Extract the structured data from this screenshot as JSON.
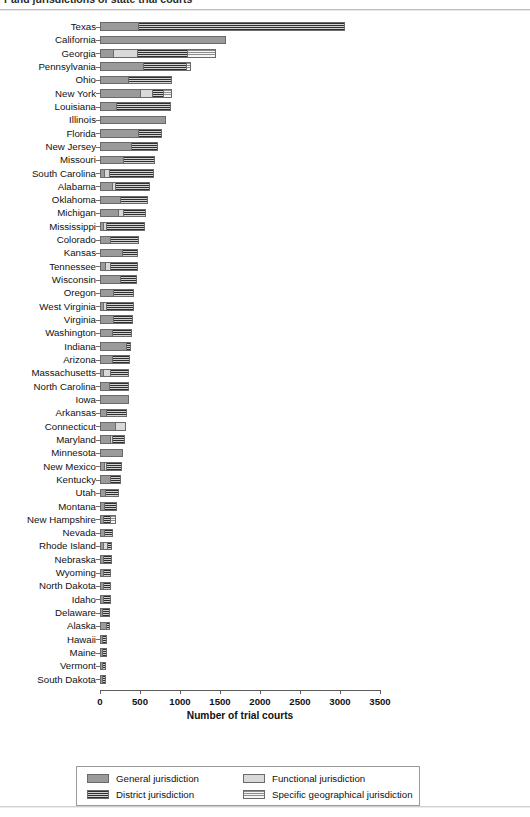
{
  "title": "r and jurisdictions of state trial courts",
  "axis": {
    "xlabel": "Number of trial courts",
    "xticks": [
      "0",
      "500",
      "1000",
      "1500",
      "2000",
      "2500",
      "3000",
      "3500"
    ]
  },
  "legend": {
    "items": [
      {
        "key": "general",
        "label": "General jurisdiction"
      },
      {
        "key": "functional",
        "label": "Functional jurisdiction"
      },
      {
        "key": "district",
        "label": "District jurisdiction"
      },
      {
        "key": "specific",
        "label": "Specific geographical jurisdiction"
      }
    ]
  },
  "colors": {
    "general": "#9a9a9a",
    "district": "#2f2f2f",
    "functional": "#d9d9d9",
    "specific": "#8d8d8d",
    "axis": "#5d5d5d",
    "frame": "#9a9a9a"
  },
  "chart_data": {
    "type": "bar",
    "orientation": "horizontal",
    "stacked": true,
    "title": "r and jurisdictions of state trial courts",
    "xlabel": "Number of trial courts",
    "ylabel": "",
    "xlim": [
      0,
      3500
    ],
    "xticks": [
      0,
      500,
      1000,
      1500,
      2000,
      2500,
      3000,
      3500
    ],
    "grid": false,
    "legend_position": "bottom",
    "series": [
      {
        "name": "General jurisdiction",
        "key": "general"
      },
      {
        "name": "District jurisdiction",
        "key": "district"
      },
      {
        "name": "Functional jurisdiction",
        "key": "functional"
      },
      {
        "name": "Specific geographical jurisdiction",
        "key": "specific"
      }
    ],
    "categories": [
      "Texas",
      "California",
      "Georgia",
      "Pennsylvania",
      "Ohio",
      "New York",
      "Louisiana",
      "Illinois",
      "Florida",
      "New Jersey",
      "Missouri",
      "South Carolina",
      "Alabama",
      "Oklahoma",
      "Michigan",
      "Mississippi",
      "Colorado",
      "Kansas",
      "Tennessee",
      "Wisconsin",
      "Oregon",
      "West Virginia",
      "Virginia",
      "Washington",
      "Indiana",
      "Arizona",
      "Massachusetts",
      "North Carolina",
      "Iowa",
      "Arkansas",
      "Connecticut",
      "Maryland",
      "Minnesota",
      "New Mexico",
      "Kentucky",
      "Utah",
      "Montana",
      "New Hampshire",
      "Nevada",
      "Rhode Island",
      "Nebraska",
      "Wyoming",
      "North Dakota",
      "Idaho",
      "Delaware",
      "Alaska",
      "Hawaii",
      "Maine",
      "Vermont",
      "South Dakota"
    ],
    "rows": [
      {
        "state": "Texas",
        "general": 470,
        "functional": 0,
        "district": 2590,
        "specific": 0,
        "total": 3060
      },
      {
        "state": "California",
        "general": 1570,
        "functional": 0,
        "district": 0,
        "specific": 0,
        "total": 1570
      },
      {
        "state": "Georgia",
        "general": 165,
        "functional": 300,
        "district": 620,
        "specific": 365,
        "total": 1450
      },
      {
        "state": "Pennsylvania",
        "general": 540,
        "functional": 0,
        "district": 540,
        "specific": 60,
        "total": 1140
      },
      {
        "state": "Ohio",
        "general": 350,
        "functional": 0,
        "district": 550,
        "specific": 0,
        "total": 900
      },
      {
        "state": "New York",
        "general": 500,
        "functional": 150,
        "district": 140,
        "specific": 110,
        "total": 900
      },
      {
        "state": "Louisiana",
        "general": 200,
        "functional": 0,
        "district": 690,
        "specific": 0,
        "total": 890
      },
      {
        "state": "Illinois",
        "general": 830,
        "functional": 0,
        "district": 0,
        "specific": 0,
        "total": 830
      },
      {
        "state": "Florida",
        "general": 480,
        "functional": 0,
        "district": 300,
        "specific": 0,
        "total": 780
      },
      {
        "state": "New Jersey",
        "general": 390,
        "functional": 0,
        "district": 340,
        "specific": 0,
        "total": 730
      },
      {
        "state": "Missouri",
        "general": 290,
        "functional": 0,
        "district": 400,
        "specific": 0,
        "total": 690
      },
      {
        "state": "South Carolina",
        "general": 50,
        "functional": 60,
        "district": 560,
        "specific": 0,
        "total": 670
      },
      {
        "state": "Alabama",
        "general": 150,
        "functional": 40,
        "district": 430,
        "specific": 0,
        "total": 620
      },
      {
        "state": "Oklahoma",
        "general": 250,
        "functional": 0,
        "district": 350,
        "specific": 0,
        "total": 600
      },
      {
        "state": "Michigan",
        "general": 220,
        "functional": 70,
        "district": 290,
        "specific": 0,
        "total": 580
      },
      {
        "state": "Mississippi",
        "general": 40,
        "functional": 30,
        "district": 490,
        "specific": 0,
        "total": 560
      },
      {
        "state": "Colorado",
        "general": 130,
        "functional": 0,
        "district": 360,
        "specific": 0,
        "total": 490
      },
      {
        "state": "Kansas",
        "general": 280,
        "functional": 0,
        "district": 200,
        "specific": 0,
        "total": 480
      },
      {
        "state": "Tennessee",
        "general": 60,
        "functional": 70,
        "district": 340,
        "specific": 0,
        "total": 470
      },
      {
        "state": "Wisconsin",
        "general": 250,
        "functional": 0,
        "district": 210,
        "specific": 0,
        "total": 460
      },
      {
        "state": "Oregon",
        "general": 160,
        "functional": 0,
        "district": 260,
        "specific": 0,
        "total": 420
      },
      {
        "state": "West Virginia",
        "general": 40,
        "functional": 30,
        "district": 350,
        "specific": 0,
        "total": 420
      },
      {
        "state": "Virginia",
        "general": 160,
        "functional": 0,
        "district": 250,
        "specific": 0,
        "total": 410
      },
      {
        "state": "Washington",
        "general": 150,
        "functional": 0,
        "district": 250,
        "specific": 0,
        "total": 400
      },
      {
        "state": "Indiana",
        "general": 330,
        "functional": 0,
        "district": 60,
        "specific": 0,
        "total": 390
      },
      {
        "state": "Arizona",
        "general": 150,
        "functional": 0,
        "district": 230,
        "specific": 0,
        "total": 380
      },
      {
        "state": "Massachusetts",
        "general": 40,
        "functional": 90,
        "district": 230,
        "specific": 0,
        "total": 360
      },
      {
        "state": "North Carolina",
        "general": 110,
        "functional": 0,
        "district": 250,
        "specific": 0,
        "total": 360
      },
      {
        "state": "Iowa",
        "general": 360,
        "functional": 0,
        "district": 0,
        "specific": 0,
        "total": 360
      },
      {
        "state": "Arkansas",
        "general": 80,
        "functional": 0,
        "district": 260,
        "specific": 0,
        "total": 340
      },
      {
        "state": "Connecticut",
        "general": 190,
        "functional": 140,
        "district": 0,
        "specific": 0,
        "total": 330
      },
      {
        "state": "Maryland",
        "general": 130,
        "functional": 20,
        "district": 160,
        "specific": 0,
        "total": 310
      },
      {
        "state": "Minnesota",
        "general": 290,
        "functional": 0,
        "district": 0,
        "specific": 0,
        "total": 290
      },
      {
        "state": "New Mexico",
        "general": 50,
        "functional": 30,
        "district": 190,
        "specific": 0,
        "total": 270
      },
      {
        "state": "Kentucky",
        "general": 130,
        "functional": 0,
        "district": 130,
        "specific": 0,
        "total": 260
      },
      {
        "state": "Utah",
        "general": 60,
        "functional": 0,
        "district": 180,
        "specific": 0,
        "total": 240
      },
      {
        "state": "Montana",
        "general": 50,
        "functional": 0,
        "district": 160,
        "specific": 0,
        "total": 210
      },
      {
        "state": "New Hampshire",
        "general": 40,
        "functional": 0,
        "district": 90,
        "specific": 70,
        "total": 200
      },
      {
        "state": "Nevada",
        "general": 50,
        "functional": 0,
        "district": 110,
        "specific": 0,
        "total": 160
      },
      {
        "state": "Rhode Island",
        "general": 40,
        "functional": 50,
        "district": 60,
        "specific": 0,
        "total": 150
      },
      {
        "state": "Nebraska",
        "general": 40,
        "functional": 0,
        "district": 110,
        "specific": 0,
        "total": 150
      },
      {
        "state": "Wyoming",
        "general": 40,
        "functional": 0,
        "district": 100,
        "specific": 0,
        "total": 140
      },
      {
        "state": "North Dakota",
        "general": 40,
        "functional": 0,
        "district": 100,
        "specific": 0,
        "total": 140
      },
      {
        "state": "Idaho",
        "general": 40,
        "functional": 0,
        "district": 95,
        "specific": 0,
        "total": 135
      },
      {
        "state": "Delaware",
        "general": 30,
        "functional": 0,
        "district": 100,
        "specific": 0,
        "total": 130
      },
      {
        "state": "Alaska",
        "general": 70,
        "functional": 0,
        "district": 55,
        "specific": 0,
        "total": 125
      },
      {
        "state": "Hawaii",
        "general": 30,
        "functional": 0,
        "district": 60,
        "specific": 0,
        "total": 90
      },
      {
        "state": "Maine",
        "general": 30,
        "functional": 0,
        "district": 55,
        "specific": 0,
        "total": 85
      },
      {
        "state": "Vermont",
        "general": 25,
        "functional": 0,
        "district": 55,
        "specific": 0,
        "total": 80
      },
      {
        "state": "South Dakota",
        "general": 25,
        "functional": 0,
        "district": 45,
        "specific": 0,
        "total": 70
      }
    ]
  }
}
